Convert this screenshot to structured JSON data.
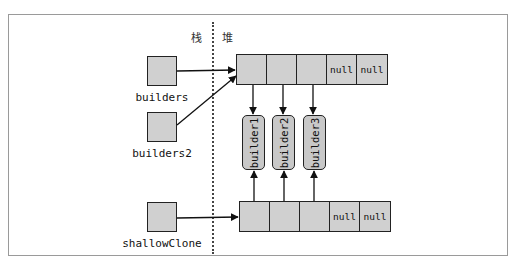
{
  "regions": {
    "stack_label": "栈",
    "heap_label": "堆"
  },
  "references": [
    {
      "name": "builders"
    },
    {
      "name": "builders2"
    },
    {
      "name": "shallowClone"
    }
  ],
  "arrays": {
    "top": {
      "cells": [
        "",
        "",
        "",
        "null",
        "null"
      ]
    },
    "bottom": {
      "cells": [
        "",
        "",
        "",
        "null",
        "null"
      ]
    }
  },
  "objects": [
    {
      "name": "builder1"
    },
    {
      "name": "builder2"
    },
    {
      "name": "builder3"
    }
  ],
  "colors": {
    "box_fill": "#d0d0d0",
    "stroke": "#222222",
    "frame": "#9a9a9a"
  }
}
